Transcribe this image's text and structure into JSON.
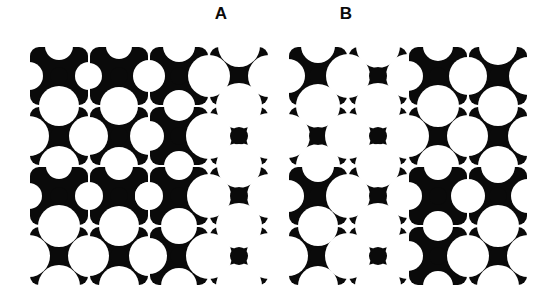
{
  "figure": {
    "type": "texture-pattern-figure",
    "background_color": "#ffffff",
    "ink_color": "#0a0a0a",
    "width": 554,
    "height": 302
  },
  "labels": {
    "panel_a": "A",
    "panel_b": "B"
  },
  "panels": [
    {
      "id": "panel-a",
      "label": "A",
      "x": 29,
      "y": 46,
      "width": 240,
      "height": 242,
      "grid_rows": 4,
      "grid_cols": 4,
      "tile_size": 60,
      "tile_bite_radii": [
        [
          14,
          13,
          16,
          21
        ],
        [
          20,
          19,
          15,
          23
        ],
        [
          13,
          14,
          14,
          22
        ],
        [
          21,
          20,
          18,
          23
        ]
      ],
      "tile_rotations": [
        [
          0,
          0,
          0,
          0
        ],
        [
          0,
          0,
          0,
          0
        ],
        [
          0,
          0,
          0,
          0
        ],
        [
          0,
          0,
          0,
          0
        ]
      ]
    },
    {
      "id": "panel-b",
      "label": "B",
      "x": 288,
      "y": 46,
      "width": 240,
      "height": 242,
      "grid_rows": 4,
      "grid_cols": 4,
      "tile_size": 60,
      "tile_bite_radii": [
        [
          17,
          22,
          15,
          19
        ],
        [
          22,
          23,
          21,
          20
        ],
        [
          16,
          22,
          14,
          17
        ],
        [
          20,
          23,
          15,
          21
        ]
      ],
      "tile_rotations": [
        [
          0,
          0,
          0,
          0
        ],
        [
          0,
          0,
          0,
          0
        ],
        [
          0,
          0,
          0,
          0
        ],
        [
          0,
          0,
          0,
          0
        ]
      ]
    }
  ],
  "tile_motif": {
    "name": "quatrefoil-pinwheel-tile",
    "corner_lobe_radius": 9,
    "center_disk_radius": 9,
    "edge_inset": 1
  }
}
